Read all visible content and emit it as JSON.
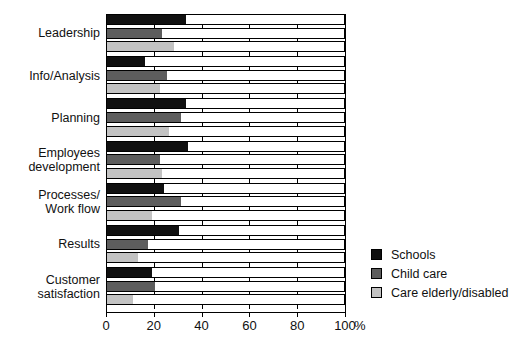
{
  "chart_data": {
    "type": "bar",
    "orientation": "horizontal",
    "title": "",
    "xlabel": "%",
    "ylabel": "",
    "xlim": [
      0,
      100
    ],
    "xticks": [
      0,
      20,
      40,
      60,
      80,
      100
    ],
    "xtick_labels": [
      "0",
      "20",
      "40",
      "60",
      "80",
      "100"
    ],
    "x_unit_label": "%",
    "grid": false,
    "legend_position": "right",
    "categories": [
      "Leadership",
      "Info/Analysis",
      "Planning",
      "Employees development",
      "Processes/ Work flow",
      "Results",
      "Customer satisfaction"
    ],
    "category_labels": [
      [
        "Leadership"
      ],
      [
        "Info/Analysis"
      ],
      [
        "Planning"
      ],
      [
        "Employees",
        "development"
      ],
      [
        "Processes/",
        "Work flow"
      ],
      [
        "Results"
      ],
      [
        "Customer",
        "satisfaction"
      ]
    ],
    "series": [
      {
        "name": "Schools",
        "color": "#101010",
        "values": [
          33,
          16,
          33,
          34,
          24,
          30,
          19
        ]
      },
      {
        "name": "Child care",
        "color": "#5d5d5d",
        "values": [
          23,
          25,
          31,
          22,
          31,
          17,
          20
        ]
      },
      {
        "name": "Care elderly/disabled",
        "color": "#c3c3c3",
        "values": [
          28,
          22,
          26,
          23,
          19,
          13,
          11
        ]
      }
    ]
  },
  "legend": {
    "items": [
      {
        "label": "Schools",
        "color": "#101010"
      },
      {
        "label": "Child care",
        "color": "#5d5d5d"
      },
      {
        "label": "Care elderly/disabled",
        "color": "#c3c3c3"
      }
    ]
  }
}
